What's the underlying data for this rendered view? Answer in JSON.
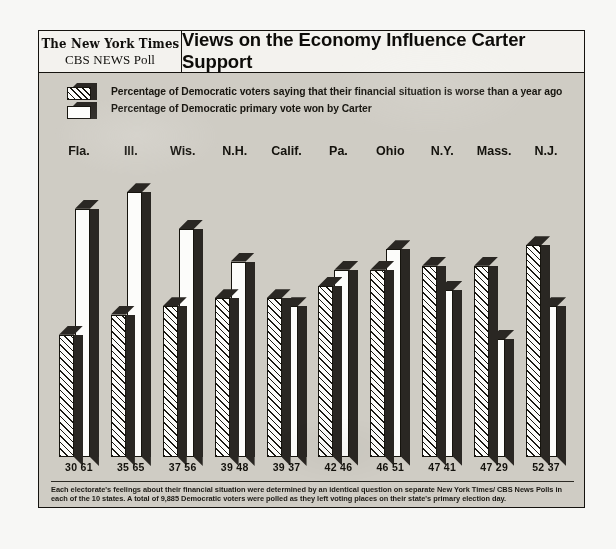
{
  "header": {
    "masthead_line1": "The New York Times",
    "masthead_line2": "CBS NEWS Poll",
    "headline": "Views on the Economy Influence Carter Support"
  },
  "legend": {
    "items": [
      {
        "label": "Percentage of Democratic voters saying that their financial situation is worse than a year ago",
        "swatch": "hatched"
      },
      {
        "label": "Percentage of Democratic primary vote won by Carter",
        "swatch": "white"
      }
    ]
  },
  "footnote": {
    "line1": "Each electorate's feelings about their financial situation were determined by an identical question on separate New York Times/ CBS News Polls in",
    "line2": "each of the 10 states. A total of 9,885 Democratic voters were polled as they left voting places on their state's primary election day."
  },
  "colors": {
    "ink": "#16140e",
    "shadow": "#2a2723",
    "paper": "#cfccc4",
    "bar_face": "#fcfcfa"
  },
  "chart_data": {
    "type": "bar",
    "title": "Views on the Economy Influence Carter Support",
    "xlabel": "",
    "ylabel": "",
    "ylim": [
      0,
      70
    ],
    "grid": false,
    "legend_position": "top-left",
    "categories": [
      "Fla.",
      "Ill.",
      "Wis.",
      "N.H.",
      "Calif.",
      "Pa.",
      "Ohio",
      "N.Y.",
      "Mass.",
      "N.J."
    ],
    "series": [
      {
        "name": "Percentage of Democratic voters saying that their financial situation is worse than a year ago",
        "values": [
          30,
          35,
          37,
          39,
          39,
          42,
          46,
          47,
          47,
          52
        ]
      },
      {
        "name": "Percentage of Democratic primary vote won by Carter",
        "values": [
          61,
          65,
          56,
          48,
          37,
          46,
          51,
          41,
          29,
          37
        ]
      }
    ],
    "value_labels": [
      "30 61",
      "35 65",
      "37 56",
      "39 48",
      "39 37",
      "42 46",
      "46 51",
      "47 41",
      "47 29",
      "52 37"
    ]
  }
}
